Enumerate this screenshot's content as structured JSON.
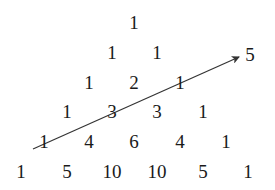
{
  "rows": [
    {
      "y": 22,
      "items": [
        {
          "value": "1",
          "x": 134
        }
      ]
    },
    {
      "y": 52,
      "items": [
        {
          "value": "1",
          "x": 112
        },
        {
          "value": "1",
          "x": 157
        }
      ]
    },
    {
      "y": 82,
      "items": [
        {
          "value": "1",
          "x": 89
        },
        {
          "value": "2",
          "x": 134
        },
        {
          "value": "1",
          "x": 180
        }
      ]
    },
    {
      "y": 111,
      "items": [
        {
          "value": "1",
          "x": 67
        },
        {
          "value": "3",
          "x": 112
        },
        {
          "value": "3",
          "x": 157
        },
        {
          "value": "1",
          "x": 203
        }
      ]
    },
    {
      "y": 141,
      "items": [
        {
          "value": "1",
          "x": 44
        },
        {
          "value": "4",
          "x": 89
        },
        {
          "value": "6",
          "x": 134
        },
        {
          "value": "4",
          "x": 180
        },
        {
          "value": "1",
          "x": 226
        }
      ]
    },
    {
      "y": 171,
      "items": [
        {
          "value": "1",
          "x": 21
        },
        {
          "value": "5",
          "x": 67
        },
        {
          "value": "10",
          "x": 112
        },
        {
          "value": "10",
          "x": 157
        },
        {
          "value": "5",
          "x": 203
        },
        {
          "value": "1",
          "x": 248
        }
      ]
    }
  ],
  "arrow": {
    "x1": 33,
    "y1": 149,
    "x2": 239,
    "y2": 57,
    "color": "#333333"
  },
  "arrow_label": {
    "value": "5",
    "x": 250,
    "y": 54
  }
}
